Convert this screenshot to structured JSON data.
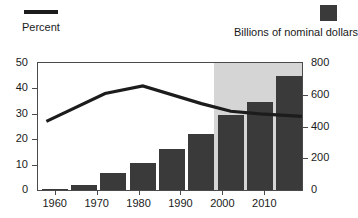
{
  "legend": {
    "series_line": {
      "label": "Percent",
      "icon": "line-swatch",
      "color": "#1c1c1c"
    },
    "series_bar": {
      "label": "Billions of nominal dollars",
      "icon": "box-swatch",
      "color": "#3a3a3a"
    }
  },
  "axes": {
    "left": {
      "ticks": [
        "0",
        "10",
        "20",
        "30",
        "40",
        "50"
      ],
      "min": 0,
      "max": 50
    },
    "right": {
      "ticks": [
        "0",
        "200",
        "400",
        "600",
        "800"
      ],
      "min": 0,
      "max": 800
    },
    "bottom": {
      "ticks": [
        "1960",
        "1970",
        "1980",
        "1990",
        "2000",
        "2010"
      ]
    }
  },
  "shading": {
    "label": "projection-region",
    "color": "#d5d5d5",
    "start_year": 1998,
    "end_year": 2019
  },
  "chart_data": {
    "type": "bar",
    "title": "",
    "subtitle": "",
    "xlabel": "",
    "ylabel": "Percent",
    "y2label": "Billions of nominal dollars",
    "grid": false,
    "legend_position": "top",
    "xlim": [
      1956,
      2019
    ],
    "ylim": [
      0,
      50
    ],
    "y2lim": [
      0,
      800
    ],
    "x": [
      1960,
      1967,
      1974,
      1981,
      1988,
      1995,
      2002,
      2009,
      2016
    ],
    "categories": [
      "1960",
      "1967",
      "1974",
      "1981",
      "1988",
      "1995",
      "2002",
      "2009",
      "2016"
    ],
    "series": [
      {
        "name": "Billions of nominal dollars",
        "type": "bar",
        "axis": "right",
        "color": "#3a3a3a",
        "values": [
          5,
          30,
          105,
          170,
          260,
          350,
          470,
          555,
          720
        ]
      },
      {
        "name": "Percent",
        "type": "line",
        "axis": "left",
        "color": "#1c1c1c",
        "x": [
          1958,
          1972,
          1981,
          1995,
          2002,
          2009,
          2019
        ],
        "values": [
          27,
          38,
          41,
          34,
          31,
          30,
          29
        ]
      }
    ],
    "annotations": [
      {
        "kind": "shaded-band",
        "label": "projection",
        "x_start": 1998,
        "x_end": 2019,
        "color": "#d5d5d5"
      }
    ]
  }
}
